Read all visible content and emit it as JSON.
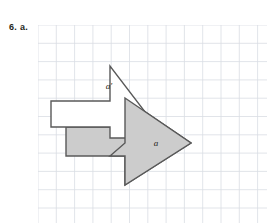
{
  "page": {
    "width": 267,
    "height": 223,
    "background": "#ffffff"
  },
  "problem": {
    "label": "6. a."
  },
  "grid": {
    "origin_x": 38,
    "origin_y": 25,
    "width": 229,
    "height": 198,
    "cell_size": 18.3,
    "line_color": "#d9dde3",
    "line_width": 0.8,
    "cols": 13,
    "rows": 11,
    "visible": true
  },
  "diagram": {
    "type": "geometry-transformation",
    "stroke_color": "#595959",
    "stroke_width": 1.4,
    "shapes": [
      {
        "name": "preimage-arrow",
        "label": "a",
        "fill": "#cccccc",
        "stroke": "#595959",
        "label_x": 118,
        "label_y": 121,
        "points": "28,102 87,102 87,73 153,118 87,160 87,131 28,131"
      },
      {
        "name": "image-arrow",
        "label": "a'",
        "fill": "#ffffff",
        "stroke": "#595959",
        "label_x": 71,
        "label_y": 64,
        "points": "13,76 72,76 72,41 127,113 72,113 72,102 13,102"
      }
    ],
    "labels": [
      {
        "name": "label-a-prime",
        "text": "a′"
      },
      {
        "name": "label-a",
        "text": "a"
      }
    ]
  },
  "colors": {
    "shaded_fill": "#cccccc",
    "unshaded_fill": "#ffffff",
    "outline": "#595959",
    "grid_line": "#d9dde3",
    "text": "#231f20"
  }
}
